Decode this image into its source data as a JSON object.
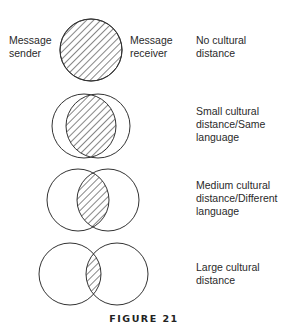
{
  "diagram": {
    "side_labels": {
      "sender": "Message\nsender",
      "receiver": "Message\nreceiver"
    },
    "rows": [
      {
        "label": "No cultural distance",
        "lines": [
          "No cultural",
          "distance"
        ],
        "left_cx": 91,
        "right_cx": 91,
        "cy": 50,
        "r": 31
      },
      {
        "label": "Small cultural distance/Same language",
        "lines": [
          "Small cultural",
          "distance/Same",
          "language"
        ],
        "left_cx": 84,
        "right_cx": 98,
        "cy": 126,
        "r": 32
      },
      {
        "label": "Medium cultural distance/Different language",
        "lines": [
          "Medium cultural",
          "distance/Different",
          "language"
        ],
        "left_cx": 78,
        "right_cx": 108,
        "cy": 200,
        "r": 31
      },
      {
        "label": "Large cultural distance",
        "lines": [
          "Large cultural",
          "distance"
        ],
        "left_cx": 70,
        "right_cx": 117,
        "cy": 274,
        "r": 31
      }
    ],
    "caption": "FIGURE 21",
    "colors": {
      "stroke": "#333333",
      "hatch": "#222222",
      "background": "#ffffff"
    }
  }
}
